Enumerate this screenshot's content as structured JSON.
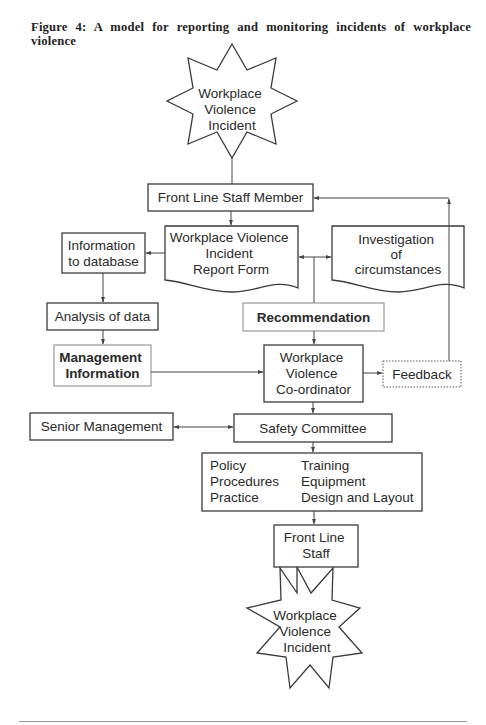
{
  "figure": {
    "caption": "Figure 4: A model for reporting and monitoring incidents of workplace violence"
  },
  "nodes": {
    "incident_top": {
      "shape": "star",
      "lines": [
        "Workplace",
        "Violence",
        "Incident"
      ]
    },
    "front_line_staff_member": {
      "shape": "box",
      "lines": [
        "Front Line Staff Member"
      ]
    },
    "report_form": {
      "shape": "document",
      "lines": [
        "Workplace Violence",
        "Incident",
        "Report Form"
      ]
    },
    "investigation": {
      "shape": "document",
      "lines": [
        "Investigation",
        "of",
        "circumstances"
      ]
    },
    "information_to_database": {
      "shape": "box",
      "lines": [
        "Information",
        "to database"
      ]
    },
    "analysis_of_data": {
      "shape": "box",
      "lines": [
        "Analysis of data"
      ]
    },
    "recommendation": {
      "shape": "box-emphasis",
      "lines": [
        "Recommendation"
      ]
    },
    "management_information": {
      "shape": "box-emphasis",
      "lines": [
        "Management",
        "Information"
      ]
    },
    "coordinator": {
      "shape": "box",
      "lines": [
        "Workplace",
        "Violence",
        "Co-ordinator"
      ]
    },
    "feedback": {
      "shape": "box-dotted",
      "lines": [
        "Feedback"
      ]
    },
    "senior_management": {
      "shape": "box",
      "lines": [
        "Senior Management"
      ]
    },
    "safety_committee": {
      "shape": "box",
      "lines": [
        "Safety Committee"
      ]
    },
    "actions": {
      "shape": "box",
      "left_column": [
        "Policy",
        "Procedures",
        "Practice"
      ],
      "right_column": [
        "Training",
        "Equipment",
        "Design and Layout"
      ]
    },
    "front_line_staff": {
      "shape": "box",
      "lines": [
        "Front Line",
        "Staff"
      ]
    },
    "incident_bottom": {
      "shape": "star",
      "lines": [
        "Workplace",
        "Violence",
        "Incident"
      ]
    }
  },
  "edges": [
    {
      "from": "Workplace Violence Incident",
      "to": "Front Line Staff Member",
      "type": "line"
    },
    {
      "from": "Front Line Staff Member",
      "to": "Workplace Violence Incident Report Form",
      "type": "arrow"
    },
    {
      "from": "Workplace Violence Incident Report Form",
      "to": "Information to database",
      "type": "arrow"
    },
    {
      "from": "Workplace Violence Incident Report Form",
      "to": "Investigation of circumstances",
      "type": "bidirectional"
    },
    {
      "from": "Report Form / Investigation",
      "to": "Recommendation",
      "type": "line"
    },
    {
      "from": "Information to database",
      "to": "Analysis of data",
      "type": "arrow"
    },
    {
      "from": "Analysis of data",
      "to": "Management Information",
      "type": "arrow"
    },
    {
      "from": "Recommendation",
      "to": "Workplace Violence Co-ordinator",
      "type": "arrow"
    },
    {
      "from": "Management Information",
      "to": "Workplace Violence Co-ordinator",
      "type": "arrow"
    },
    {
      "from": "Workplace Violence Co-ordinator",
      "to": "Feedback",
      "type": "arrow"
    },
    {
      "from": "Feedback",
      "to": "Front Line Staff Member",
      "type": "arrow"
    },
    {
      "from": "Workplace Violence Co-ordinator",
      "to": "Safety Committee",
      "type": "arrow"
    },
    {
      "from": "Senior Management",
      "to": "Safety Committee",
      "type": "bidirectional"
    },
    {
      "from": "Safety Committee",
      "to": "Policy / Training box",
      "type": "arrow"
    },
    {
      "from": "Policy / Training box",
      "to": "Front Line Staff",
      "type": "arrow"
    },
    {
      "from": "Front Line Staff",
      "to": "Workplace Violence Incident",
      "type": "adjacent"
    }
  ],
  "colors": {
    "stroke": "#3a3a3a",
    "emphasis_stroke": "#9a9a9a",
    "text": "#2a2a2a",
    "background": "#ffffff"
  }
}
